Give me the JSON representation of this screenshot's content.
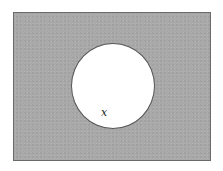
{
  "diagram": {
    "type": "venn",
    "universe": {
      "label": "",
      "fill_color": "#a9a9a9",
      "border_color": "#6a6a6a",
      "shaded": true
    },
    "sets": [
      {
        "label": "x",
        "fill_color": "#ffffff",
        "border_color": "#555555",
        "shaded": false
      }
    ],
    "shaded_region": "complement of x"
  }
}
